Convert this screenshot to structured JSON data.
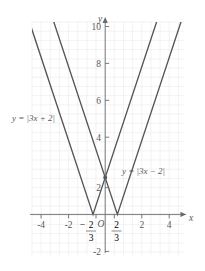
{
  "figure": {
    "kind": "coordinate-plane-graph",
    "background": "#ffffff",
    "grid_color": "#ece7e8",
    "axis_color": "#6b6b6f",
    "curve_color": "#555559",
    "text_color": "#58585c"
  },
  "axes": {
    "x_axis_label": "x",
    "y_axis_label": "y",
    "origin_label": "O",
    "x_ticks": [
      "-4",
      "-2",
      "2",
      "4"
    ],
    "y_ticks": [
      "10",
      "8",
      "6",
      "4",
      "2",
      "-2"
    ],
    "special_x_ticks": [
      {
        "sign": "−",
        "numerator": "2",
        "denominator": "3"
      },
      {
        "sign": "",
        "numerator": "2",
        "denominator": "3"
      }
    ]
  },
  "labels": {
    "left_curve": "y = |3x + 2|",
    "right_curve": "y = |3x − 2|"
  },
  "chart_data": {
    "type": "line",
    "title": "",
    "xlabel": "x",
    "ylabel": "y",
    "xlim": [
      -4.6,
      4.6
    ],
    "ylim": [
      -2.6,
      10.8
    ],
    "grid": true,
    "grid_step": 0.5,
    "xticks": [
      -4,
      -2,
      -0.6667,
      0.6667,
      2,
      4
    ],
    "xticklabels": [
      "-4",
      "-2",
      "-2/3",
      "2/3",
      "2",
      "4"
    ],
    "yticks": [
      -2,
      2,
      4,
      6,
      8,
      10
    ],
    "yticklabels": [
      "-2",
      "2",
      "4",
      "6",
      "8",
      "10"
    ],
    "legend_position": "inline-annotations",
    "annotations": [
      {
        "text": "y = |3x + 2|",
        "x": -4.15,
        "y": 5.1
      },
      {
        "text": "y = |3x − 2|",
        "x": 1.15,
        "y": 2.85
      },
      {
        "text": "O",
        "x": -0.22,
        "y": -0.55
      }
    ],
    "series": [
      {
        "name": "y = |3x + 2|",
        "expression": "y = |3x + 2|",
        "vertex": [
          -0.6667,
          0
        ],
        "slope_left": -3,
        "slope_right": 3,
        "points": [
          [
            -4,
            10
          ],
          [
            -0.6667,
            0
          ],
          [
            4,
            14
          ]
        ]
      },
      {
        "name": "y = |3x - 2|",
        "expression": "y = |3x − 2|",
        "vertex": [
          0.6667,
          0
        ],
        "slope_left": -3,
        "slope_right": 3,
        "points": [
          [
            -4,
            14
          ],
          [
            0.6667,
            0
          ],
          [
            4,
            10
          ]
        ]
      }
    ],
    "intersection_points": [
      [
        0,
        2
      ]
    ]
  }
}
